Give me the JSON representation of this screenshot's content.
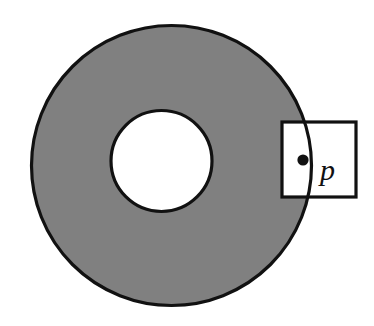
{
  "figure": {
    "kind": "geometry-diagram",
    "background_color": "#ffffff",
    "stroke_color": "#111111",
    "shading_color": "#808080",
    "hole_fill_color": "#ffffff",
    "window_fill_color": "#ffffff",
    "outer_circle": {
      "name": "outer-boundary-circle",
      "cx": 171.5,
      "cy": 165.5,
      "r": 140.0,
      "stroke_width": 3.2,
      "fill": "#808080"
    },
    "inner_circle": {
      "name": "inner-boundary-circle",
      "cx": 161.5,
      "cy": 161.0,
      "r": 50.5,
      "stroke_width": 3.2,
      "fill": "#ffffff"
    },
    "window_square": {
      "name": "neighborhood-window",
      "x": 282.0,
      "y": 122.0,
      "width": 74.0,
      "height": 75.0,
      "stroke_width": 3.2,
      "fill": "#ffffff"
    },
    "point": {
      "name": "point-p",
      "cx": 303.0,
      "cy": 160.0,
      "r": 5.6,
      "fill": "#111111"
    },
    "label": {
      "text": "p",
      "x": 320.0,
      "y": 180.0,
      "font_size": 30,
      "style": "italic",
      "color": "#111111"
    }
  }
}
